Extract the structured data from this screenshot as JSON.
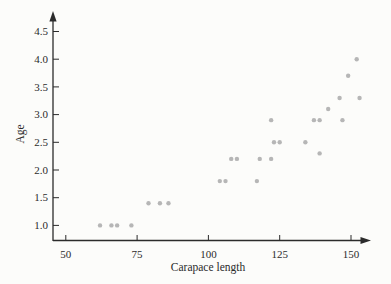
{
  "chart_data": {
    "type": "scatter",
    "title": "",
    "xlabel": "Carapace length",
    "ylabel": "Age",
    "x_ticks": [
      {
        "value": 50,
        "label": "50"
      },
      {
        "value": 75,
        "label": "75"
      },
      {
        "value": 100,
        "label": "100"
      },
      {
        "value": 125,
        "label": "125"
      },
      {
        "value": 150,
        "label": "150"
      }
    ],
    "y_ticks": [
      {
        "value": 1.0,
        "label": "1.0"
      },
      {
        "value": 1.5,
        "label": "1.5"
      },
      {
        "value": 2.0,
        "label": "2.0"
      },
      {
        "value": 2.5,
        "label": "2.5"
      },
      {
        "value": 3.0,
        "label": "3.0"
      },
      {
        "value": 3.5,
        "label": "3.5"
      },
      {
        "value": 4.0,
        "label": "4.0"
      },
      {
        "value": 4.5,
        "label": "4.5"
      }
    ],
    "xlim": [
      45.5,
      157
    ],
    "ylim": [
      0.72,
      4.85
    ],
    "grid": false,
    "legend": "none",
    "points": [
      {
        "x": 62,
        "y": 1.0
      },
      {
        "x": 66,
        "y": 1.0
      },
      {
        "x": 68,
        "y": 1.0
      },
      {
        "x": 73,
        "y": 1.0
      },
      {
        "x": 79,
        "y": 1.4
      },
      {
        "x": 83,
        "y": 1.4
      },
      {
        "x": 86,
        "y": 1.4
      },
      {
        "x": 104,
        "y": 1.8
      },
      {
        "x": 106,
        "y": 1.8
      },
      {
        "x": 117,
        "y": 1.8
      },
      {
        "x": 108,
        "y": 2.2
      },
      {
        "x": 110,
        "y": 2.2
      },
      {
        "x": 118,
        "y": 2.2
      },
      {
        "x": 122,
        "y": 2.2
      },
      {
        "x": 139,
        "y": 2.3
      },
      {
        "x": 123,
        "y": 2.5
      },
      {
        "x": 125,
        "y": 2.5
      },
      {
        "x": 134,
        "y": 2.5
      },
      {
        "x": 122,
        "y": 2.9
      },
      {
        "x": 137,
        "y": 2.9
      },
      {
        "x": 139,
        "y": 2.9
      },
      {
        "x": 147,
        "y": 2.9
      },
      {
        "x": 142,
        "y": 3.1
      },
      {
        "x": 146,
        "y": 3.3
      },
      {
        "x": 153,
        "y": 3.3
      },
      {
        "x": 149,
        "y": 3.7
      },
      {
        "x": 152,
        "y": 4.0
      }
    ],
    "point_color": "#b6b6b6",
    "axis_color": "#2b2b2b",
    "background_color": "#fcfcfa"
  }
}
